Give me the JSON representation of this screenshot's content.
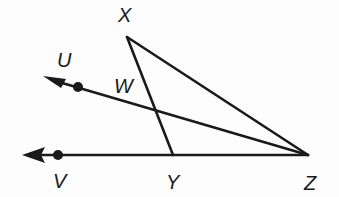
{
  "diagram": {
    "type": "geometry",
    "colors": {
      "stroke": "#1a1a1a",
      "background": "#fdfdfd"
    },
    "points": {
      "X": {
        "label": "X",
        "x": 127,
        "y": 37,
        "label_x": 118,
        "label_y": 22
      },
      "Z": {
        "label": "Z",
        "x": 308,
        "y": 155,
        "label_x": 304,
        "label_y": 190
      },
      "Y": {
        "label": "Y",
        "x": 173,
        "y": 155,
        "label_x": 166,
        "label_y": 189
      },
      "U": {
        "label": "U",
        "x": 78,
        "y": 87,
        "label_x": 57,
        "label_y": 67
      },
      "V": {
        "label": "V",
        "x": 58,
        "y": 154,
        "label_x": 53,
        "label_y": 188
      },
      "W": {
        "label": "W",
        "label_x": 114,
        "label_y": 93
      }
    },
    "segments": [
      "XZ",
      "XY",
      "YZ"
    ],
    "rays": [
      {
        "name": "ZU",
        "from": "Z",
        "through": "U"
      },
      {
        "name": "ZV",
        "from": "Z",
        "through": "V"
      }
    ],
    "labels": [
      "X",
      "U",
      "W",
      "V",
      "Y",
      "Z"
    ]
  }
}
